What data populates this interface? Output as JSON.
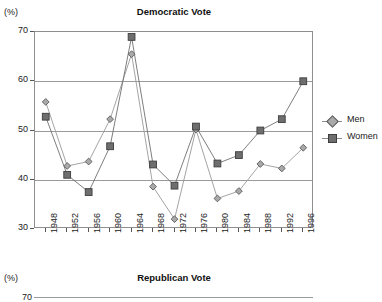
{
  "charts": [
    {
      "title": "Democratic Vote",
      "unit_label": "(%)",
      "legend": [
        {
          "label": "Men",
          "marker": "diamond-marker"
        },
        {
          "label": "Women",
          "marker": "square-marker"
        }
      ]
    },
    {
      "title": "Republican Vote",
      "unit_label": "(%)",
      "first_ytick": "70"
    }
  ],
  "chart_data": {
    "type": "line",
    "title": "Democratic Vote",
    "xlabel": "",
    "ylabel": "(%)",
    "ylim": [
      30,
      70
    ],
    "yticks": [
      30,
      40,
      50,
      60,
      70
    ],
    "grid": true,
    "legend_position": "right",
    "categories": [
      "1948",
      "1952",
      "1956",
      "1960",
      "1964",
      "1968",
      "1972",
      "1976",
      "1980",
      "1984",
      "1988",
      "1992",
      "1996"
    ],
    "series": [
      {
        "name": "Men",
        "marker": "diamond",
        "values": [
          55.8,
          42.8,
          43.7,
          52.3,
          65.5,
          38.6,
          32.0,
          50.2,
          36.2,
          37.7,
          43.2,
          42.3,
          46.5
        ]
      },
      {
        "name": "Women",
        "marker": "square",
        "values": [
          52.8,
          41.0,
          37.5,
          46.8,
          69.0,
          43.1,
          38.8,
          50.8,
          43.3,
          45.0,
          50.0,
          52.3,
          60.0
        ]
      }
    ]
  }
}
